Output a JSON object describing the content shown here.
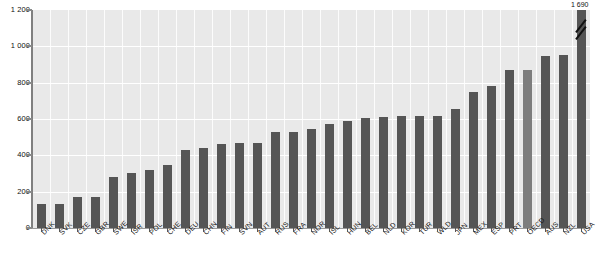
{
  "chart_data": {
    "type": "bar",
    "title": "",
    "subtitle": "",
    "xlabel": "",
    "ylabel": "",
    "ylim": [
      0,
      1200
    ],
    "ytick_labels": [
      "0",
      "200",
      "400",
      "600",
      "800",
      "1 000",
      "1 200"
    ],
    "ytick_values": [
      0,
      200,
      400,
      600,
      800,
      1000,
      1200
    ],
    "grid": "horizontal-and-vertical-white",
    "legend": "none",
    "categories": [
      "DNK",
      "SVK",
      "CZE",
      "GBR",
      "SWE",
      "ISR",
      "POL",
      "CHE",
      "DEU",
      "CHN",
      "FIN",
      "SVN",
      "AUT",
      "RUS",
      "FRA",
      "NOR",
      "ISL",
      "HUN",
      "BEL",
      "NLD",
      "KOR",
      "TUR",
      "WLD",
      "JPN",
      "MEX",
      "ESP",
      "PRT",
      "OECD",
      "AUS",
      "NZL",
      "USA"
    ],
    "values": [
      130,
      130,
      170,
      170,
      280,
      305,
      320,
      345,
      430,
      440,
      460,
      470,
      470,
      530,
      530,
      545,
      570,
      590,
      605,
      610,
      615,
      615,
      615,
      655,
      750,
      780,
      870,
      870,
      945,
      950,
      1690
    ],
    "highlight_category": "OECD",
    "truncated_bars": [
      {
        "category": "USA",
        "value": 1690,
        "label": "1 690",
        "axis_max": 1200
      }
    ],
    "annotations": [
      {
        "text": "1 690",
        "target": "USA"
      }
    ],
    "colors": {
      "bar": "#555555",
      "bar_highlight": "#7d7d7d",
      "plot_background": "#e9e9e9",
      "gridline": "#ffffff",
      "axis": "#808080",
      "text": "#111111",
      "page_background": "#ffffff"
    }
  }
}
